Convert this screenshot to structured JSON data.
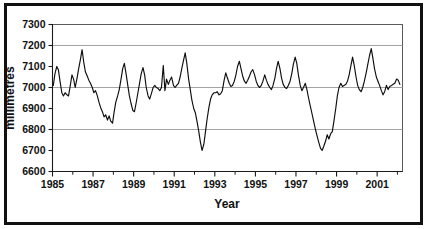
{
  "figure": {
    "frame_color": "#111111",
    "background": "#ffffff",
    "line_color": "#0d0d0d",
    "grid_color": "#9a9a9a"
  },
  "axes": {
    "y_title": "millimetres",
    "x_title": "Year",
    "y_ticks": [
      "7300",
      "7200",
      "7100",
      "7000",
      "6900",
      "6800",
      "6700",
      "6600"
    ],
    "x_ticks": [
      "1985",
      "1987",
      "1989",
      "1991",
      "1993",
      "1995",
      "1997",
      "1999",
      "2001"
    ]
  },
  "chart_data": {
    "type": "line",
    "title": "",
    "subtitle": "",
    "xlabel": "Year",
    "ylabel": "millimetres",
    "xlim": [
      1985.0,
      2002.25
    ],
    "ylim": [
      6600,
      7300
    ],
    "grid": true,
    "gridlines_y": [
      7200,
      7000,
      6800
    ],
    "legend": false,
    "x_tick_values": [
      1985,
      1987,
      1989,
      1991,
      1993,
      1995,
      1997,
      1999,
      2001
    ],
    "y_tick_values": [
      6600,
      6700,
      6800,
      6900,
      7000,
      7100,
      7200,
      7300
    ],
    "minor_x_tick_step": 1,
    "series": [
      {
        "name": "millimetres",
        "color": "#0d0d0d",
        "x": [
          1985.04,
          1985.12,
          1985.21,
          1985.29,
          1985.37,
          1985.46,
          1985.54,
          1985.62,
          1985.71,
          1985.79,
          1985.87,
          1985.96,
          1986.04,
          1986.12,
          1986.21,
          1986.29,
          1986.37,
          1986.46,
          1986.54,
          1986.62,
          1986.71,
          1986.79,
          1986.87,
          1986.96,
          1987.04,
          1987.12,
          1987.21,
          1987.29,
          1987.37,
          1987.46,
          1987.54,
          1987.62,
          1987.71,
          1987.79,
          1987.87,
          1987.96,
          1988.04,
          1988.12,
          1988.21,
          1988.29,
          1988.37,
          1988.46,
          1988.54,
          1988.62,
          1988.71,
          1988.79,
          1988.87,
          1988.96,
          1989.04,
          1989.12,
          1989.21,
          1989.29,
          1989.37,
          1989.46,
          1989.54,
          1989.62,
          1989.71,
          1989.79,
          1989.87,
          1989.96,
          1990.04,
          1990.12,
          1990.21,
          1990.29,
          1990.37,
          1990.46,
          1990.54,
          1990.62,
          1990.71,
          1990.79,
          1990.87,
          1990.96,
          1991.04,
          1991.12,
          1991.21,
          1991.29,
          1991.37,
          1991.46,
          1991.54,
          1991.62,
          1991.71,
          1991.79,
          1991.87,
          1991.96,
          1992.04,
          1992.12,
          1992.21,
          1992.29,
          1992.37,
          1992.46,
          1992.54,
          1992.62,
          1992.71,
          1992.79,
          1992.87,
          1992.96,
          1993.04,
          1993.12,
          1993.21,
          1993.29,
          1993.37,
          1993.46,
          1993.54,
          1993.62,
          1993.71,
          1993.79,
          1993.87,
          1993.96,
          1994.04,
          1994.12,
          1994.21,
          1994.29,
          1994.37,
          1994.46,
          1994.54,
          1994.62,
          1994.71,
          1994.79,
          1994.87,
          1994.96,
          1995.04,
          1995.12,
          1995.21,
          1995.29,
          1995.37,
          1995.46,
          1995.54,
          1995.62,
          1995.71,
          1995.79,
          1995.87,
          1995.96,
          1996.04,
          1996.12,
          1996.21,
          1996.29,
          1996.37,
          1996.46,
          1996.54,
          1996.62,
          1996.71,
          1996.79,
          1996.87,
          1996.96,
          1997.04,
          1997.12,
          1997.21,
          1997.29,
          1997.37,
          1997.46,
          1997.54,
          1997.62,
          1997.71,
          1997.79,
          1997.87,
          1997.96,
          1998.04,
          1998.12,
          1998.21,
          1998.29,
          1998.37,
          1998.46,
          1998.54,
          1998.62,
          1998.71,
          1998.79,
          1998.87,
          1998.96,
          1999.04,
          1999.12,
          1999.21,
          1999.29,
          1999.37,
          1999.46,
          1999.54,
          1999.62,
          1999.71,
          1999.79,
          1999.87,
          1999.96,
          2000.04,
          2000.12,
          2000.21,
          2000.29,
          2000.37,
          2000.46,
          2000.54,
          2000.62,
          2000.71,
          2000.79,
          2000.87,
          2000.96,
          2001.04,
          2001.12,
          2001.21,
          2001.29,
          2001.37,
          2001.46,
          2001.54,
          2001.62,
          2001.71,
          2001.79,
          2001.87,
          2001.96,
          2002.04,
          2002.12
        ],
        "values": [
          7010,
          7065,
          7100,
          7085,
          7030,
          6975,
          6960,
          6975,
          6965,
          6960,
          7005,
          7060,
          7040,
          7000,
          7045,
          7090,
          7130,
          7180,
          7120,
          7075,
          7055,
          7035,
          7020,
          7000,
          6975,
          6985,
          6960,
          6930,
          6905,
          6885,
          6860,
          6870,
          6845,
          6865,
          6840,
          6830,
          6885,
          6930,
          6960,
          6990,
          7035,
          7090,
          7115,
          7070,
          7010,
          6960,
          6925,
          6890,
          6885,
          6925,
          6975,
          7020,
          7065,
          7095,
          7060,
          7000,
          6960,
          6945,
          6970,
          7000,
          7010,
          7000,
          6995,
          6985,
          7000,
          7105,
          6985,
          7040,
          7015,
          7035,
          7050,
          7010,
          7000,
          7010,
          7020,
          7050,
          7090,
          7130,
          7165,
          7115,
          7040,
          6990,
          6940,
          6900,
          6880,
          6840,
          6790,
          6740,
          6700,
          6730,
          6790,
          6850,
          6905,
          6945,
          6965,
          6975,
          6975,
          6980,
          6965,
          6970,
          6985,
          7035,
          7070,
          7045,
          7020,
          7005,
          7010,
          7030,
          7060,
          7100,
          7125,
          7090,
          7055,
          7030,
          7020,
          7035,
          7055,
          7075,
          7085,
          7060,
          7030,
          7010,
          7000,
          7010,
          7030,
          7060,
          7035,
          7015,
          7000,
          6990,
          7010,
          7045,
          7090,
          7125,
          7090,
          7045,
          7015,
          7000,
          6995,
          7010,
          7030,
          7065,
          7110,
          7145,
          7115,
          7060,
          7010,
          6985,
          7000,
          7020,
          6990,
          6950,
          6910,
          6875,
          6840,
          6800,
          6770,
          6740,
          6710,
          6700,
          6720,
          6745,
          6775,
          6755,
          6780,
          6790,
          6840,
          6900,
          6960,
          7000,
          7020,
          7005,
          7010,
          7015,
          7030,
          7060,
          7105,
          7145,
          7105,
          7050,
          7010,
          6990,
          6980,
          7000,
          7030,
          7070,
          7110,
          7150,
          7185,
          7140,
          7090,
          7050,
          7030,
          7010,
          6985,
          6965,
          6980,
          7010,
          6990,
          7005,
          7010,
          7015,
          7020,
          7040,
          7035,
          7015
        ]
      }
    ]
  }
}
